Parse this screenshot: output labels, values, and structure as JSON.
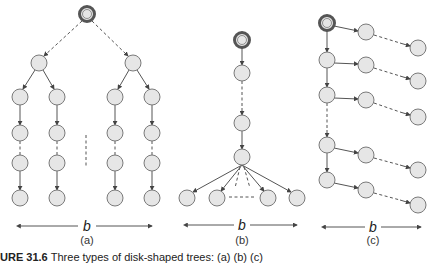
{
  "figure": {
    "panels": [
      {
        "id": "a",
        "label": "(a)",
        "width_label": "b",
        "description": "shallow, wide tree: root with two children, each with two chains"
      },
      {
        "id": "b",
        "label": "(b)",
        "width_label": "b",
        "description": "deep chain ending in a node with b leaves"
      },
      {
        "id": "c",
        "label": "(c)",
        "width_label": "b",
        "description": "spine of nodes each with a chain branching right"
      }
    ],
    "caption_prefix": "URE 31.6",
    "caption_text": "Three types of disk-shaped trees: (a) (b) (c)"
  },
  "colors": {
    "node_fill": "#e6e6e6",
    "node_stroke": "#7a7a7a",
    "root_stroke": "#555555",
    "edge": "#555555"
  }
}
